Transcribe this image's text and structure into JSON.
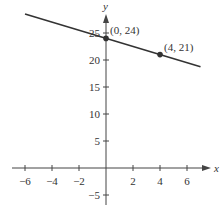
{
  "chart_data": {
    "type": "line",
    "title": "",
    "xlabel": "x",
    "ylabel": "y",
    "xlim": [
      -7,
      7.5
    ],
    "ylim": [
      -7,
      29
    ],
    "x_ticks": [
      -6,
      -4,
      -2,
      2,
      4,
      6
    ],
    "y_ticks": [
      -5,
      5,
      10,
      15,
      20,
      25
    ],
    "x_tick_labels": [
      "−6",
      "−4",
      "−2",
      "2",
      "4",
      "6"
    ],
    "y_tick_labels": [
      "−5",
      "5",
      "10",
      "15",
      "20",
      "25"
    ],
    "grid": false,
    "legend": null,
    "series": [
      {
        "name": "line",
        "equation": "y = -0.75x + 24",
        "slope": -0.75,
        "intercept": 24,
        "x_range": [
          -6,
          7
        ]
      }
    ],
    "points": [
      {
        "x": 0,
        "y": 24,
        "label": "(0, 24)"
      },
      {
        "x": 4,
        "y": 21,
        "label": "(4, 21)"
      }
    ],
    "colors": {
      "line": "#333333",
      "axes": "#444444",
      "text": "#333333"
    }
  }
}
